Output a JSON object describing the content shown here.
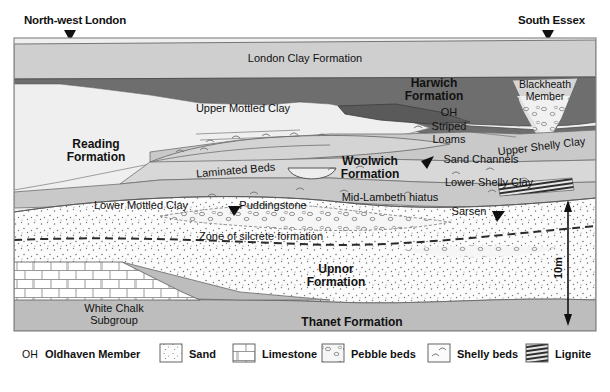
{
  "figure": {
    "type": "geological-cross-section",
    "title_left": "North-west London",
    "title_right": "South Essex",
    "scale_label": "10m"
  },
  "locations": [
    {
      "name": "North-west London",
      "x": 24,
      "marker_x": 70
    },
    {
      "name": "South Essex",
      "x": 518,
      "marker_x": 548
    }
  ],
  "units": {
    "london_clay": "London Clay Formation",
    "harwich": "Harwich\nFormation",
    "harwich_line1": "Harwich",
    "harwich_line2": "Formation",
    "blackheath_line1": "Blackheath",
    "blackheath_line2": "Member",
    "reading_line1": "Reading",
    "reading_line2": "Formation",
    "woolwich_line1": "Woolwich",
    "woolwich_line2": "Formation",
    "upnor_line1": "Upnor",
    "upnor_line2": "Formation",
    "thanet": "Thanet Formation",
    "chalk_line1": "White Chalk",
    "chalk_line2": "Subgroup"
  },
  "beds": {
    "upper_mottled_clay": "Upper Mottled Clay",
    "lower_mottled_clay": "Lower Mottled Clay",
    "laminated_beds": "Laminated Beds",
    "puddingstone": "Puddingstone",
    "oh": "OH",
    "striped_line1": "Striped",
    "striped_line2": "Loams",
    "upper_shelly_clay": "Upper Shelly Clay",
    "lower_shelly_clay": "Lower Shelly Clay",
    "sand_channels": "Sand Channels",
    "mid_lambeth_hiatus": "Mid-Lambeth hiatus",
    "zone_silcrete": "Zone of silcrete formation",
    "sarsen": "Sarsen"
  },
  "legend": {
    "oh_abbrev": "OH",
    "items": [
      {
        "key": "oldhaven",
        "label": "Oldhaven Member",
        "swatch": "abbrev"
      },
      {
        "key": "sand",
        "label": "Sand",
        "swatch": "sand-pattern"
      },
      {
        "key": "limestone",
        "label": "Limestone",
        "swatch": "limestone-pattern"
      },
      {
        "key": "pebble",
        "label": "Pebble beds",
        "swatch": "pebble-pattern"
      },
      {
        "key": "shelly",
        "label": "Shelly beds",
        "swatch": "shelly-pattern"
      },
      {
        "key": "lignite",
        "label": "Lignite",
        "swatch": "lignite-pattern"
      }
    ]
  },
  "colors": {
    "london_clay_fill": "#cfcfcf",
    "harwich_fill": "#6e6e6e",
    "reading_fill": "#ececec",
    "woolwich_fill": "#c6c6c6",
    "woolwich_light": "#d8d8d8",
    "upnor_fill": "#fbfbfb",
    "thanet_fill": "#bdbdbd",
    "chalk_fill": "#ffffff",
    "stroke": "#4a4a4a",
    "text": "#111111"
  }
}
